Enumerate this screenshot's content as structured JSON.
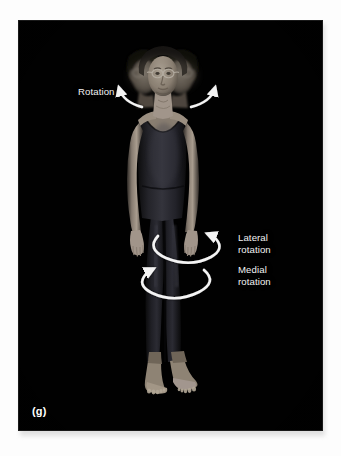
{
  "figure": {
    "panel_letter": "(g)",
    "background_color": "#fdfdfd",
    "plate_color": "#010101",
    "annotation_color": "#f2f2f2",
    "subject_description": "multiple-exposure photograph of a standing woman in a dark unitard demonstrating rotation movements"
  },
  "annotations": [
    {
      "id": "rotation",
      "label": "Rotation",
      "body_region": "head-and-neck",
      "arrow_style": "paired-curved-arrows"
    },
    {
      "id": "lateral-rotation",
      "label": "Lateral\nrotation",
      "body_region": "hip-thigh",
      "arrow_style": "elliptical-arrow-clockwise"
    },
    {
      "id": "medial-rotation",
      "label": "Medial\nrotation",
      "body_region": "hip-thigh",
      "arrow_style": "elliptical-arrow-counterclockwise"
    }
  ]
}
